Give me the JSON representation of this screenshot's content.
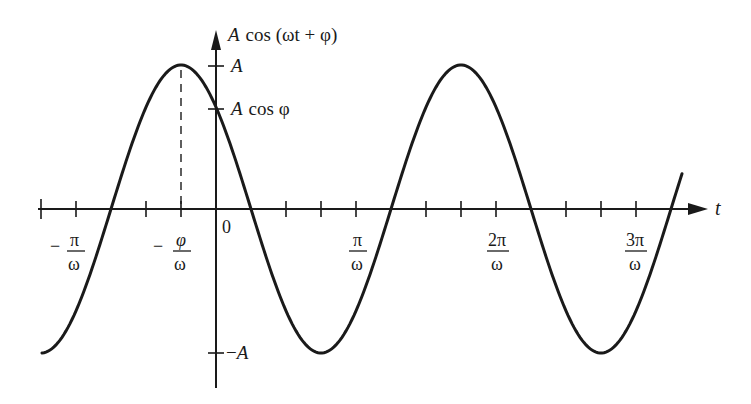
{
  "chart_data": {
    "type": "line",
    "title": "",
    "function": "A cos(ωt + φ)",
    "ylabel": "A cos (ωt + φ)",
    "xlabel": "t",
    "y_ticks": [
      {
        "label": "A",
        "value": 1.0
      },
      {
        "label": "A cos φ",
        "value": 0.56
      },
      {
        "label": "−A",
        "value": -1.0
      }
    ],
    "x_ticks": [
      {
        "label": "−π/ω",
        "value": -1.0
      },
      {
        "label": "−φ/ω",
        "value": -0.5
      },
      {
        "label": "0",
        "value": 0.0
      },
      {
        "label": "π/ω",
        "value": 1.0
      },
      {
        "label": "2π/ω",
        "value": 2.0
      },
      {
        "label": "3π/ω",
        "value": 3.0
      }
    ],
    "x_units": "π/ω",
    "phase_phi": "≈0.5π",
    "curve": {
      "x": [
        -1.5,
        -1.0,
        -0.5,
        0.0,
        0.5,
        1.0,
        1.5,
        2.0,
        2.5,
        3.0,
        3.5
      ],
      "y": [
        -1.0,
        0.0,
        1.0,
        0.56,
        -0.5,
        -0.96,
        0.0,
        1.0,
        0.0,
        -1.0,
        0.25
      ]
    },
    "annotations": [
      "dashed vertical line at t = −φ/ω from peak to axis"
    ],
    "grid": false,
    "legend": null
  },
  "labels": {
    "y_axis_title_prefix": "A",
    "y_axis_title_rest": "cos (ωt + φ)",
    "y_tick_A": "A",
    "y_tick_Acos_A": "A",
    "y_tick_Acos_rest": "cos φ",
    "y_tick_negA_minus": "−",
    "y_tick_negA_A": "A",
    "x_axis_title": "t",
    "origin": "0",
    "minus": "−",
    "pi": "π",
    "phi": "φ",
    "omega": "ω",
    "two_pi": "2π",
    "three_pi": "3π"
  }
}
